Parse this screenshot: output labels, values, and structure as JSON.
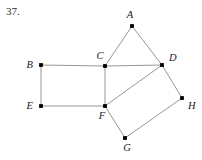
{
  "figure": {
    "problem_number": "37.",
    "caption": "",
    "width": 202,
    "height": 160,
    "background_color": "#ffffff",
    "edge_color": "#8a8a8a",
    "vertex_color": "#000000",
    "label_color": "#1a1a1a"
  },
  "graph": {
    "type": "undirected-graph",
    "vertex_count": 8,
    "edge_count": 11,
    "vertices": [
      {
        "id": "A",
        "label": "A",
        "x": 132,
        "y": 26,
        "label_x": 130,
        "label_y": 18,
        "label_anchor": "middle"
      },
      {
        "id": "B",
        "label": "B",
        "x": 41,
        "y": 65,
        "label_x": 33,
        "label_y": 68,
        "label_anchor": "end"
      },
      {
        "id": "C",
        "label": "C",
        "x": 105,
        "y": 66,
        "label_x": 100,
        "label_y": 59,
        "label_anchor": "middle"
      },
      {
        "id": "D",
        "label": "D",
        "x": 162,
        "y": 65,
        "label_x": 169,
        "label_y": 61,
        "label_anchor": "start"
      },
      {
        "id": "E",
        "label": "E",
        "x": 41,
        "y": 106,
        "label_x": 33,
        "label_y": 109,
        "label_anchor": "end"
      },
      {
        "id": "F",
        "label": "F",
        "x": 105,
        "y": 106,
        "label_x": 102,
        "label_y": 119,
        "label_anchor": "middle"
      },
      {
        "id": "G",
        "label": "G",
        "x": 125,
        "y": 138,
        "label_x": 127,
        "label_y": 151,
        "label_anchor": "middle"
      },
      {
        "id": "H",
        "label": "H",
        "x": 182,
        "y": 98,
        "label_x": 188,
        "label_y": 109,
        "label_anchor": "start"
      }
    ],
    "edges": [
      {
        "from": "A",
        "to": "C"
      },
      {
        "from": "A",
        "to": "D"
      },
      {
        "from": "B",
        "to": "C"
      },
      {
        "from": "B",
        "to": "E"
      },
      {
        "from": "C",
        "to": "D"
      },
      {
        "from": "C",
        "to": "F"
      },
      {
        "from": "D",
        "to": "F"
      },
      {
        "from": "D",
        "to": "H"
      },
      {
        "from": "E",
        "to": "F"
      },
      {
        "from": "F",
        "to": "G"
      },
      {
        "from": "G",
        "to": "H"
      }
    ]
  }
}
